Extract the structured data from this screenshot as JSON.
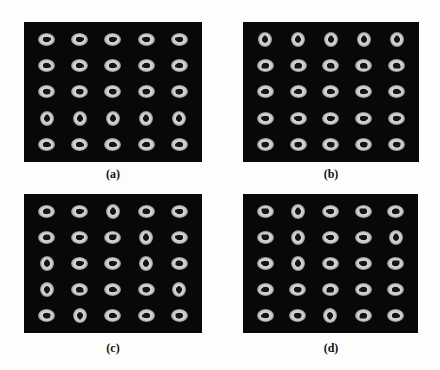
{
  "figure": {
    "panels": [
      {
        "id": "a",
        "caption": "(a)",
        "grid": [
          [
            "h",
            "h",
            "h",
            "h",
            "h"
          ],
          [
            "h",
            "h",
            "h",
            "h",
            "h"
          ],
          [
            "t",
            "t",
            "t",
            "t",
            "t"
          ],
          [
            "v",
            "v",
            "v",
            "v",
            "v"
          ],
          [
            "h",
            "h",
            "h",
            "h",
            "h"
          ]
        ]
      },
      {
        "id": "b",
        "caption": "(b)",
        "grid": [
          [
            "v",
            "v",
            "v",
            "v",
            "v"
          ],
          [
            "b",
            "b",
            "b",
            "b",
            "b"
          ],
          [
            "h",
            "h",
            "h",
            "h",
            "h"
          ],
          [
            "h",
            "h",
            "h",
            "h",
            "h"
          ],
          [
            "t",
            "t",
            "t",
            "t",
            "t"
          ]
        ]
      },
      {
        "id": "c",
        "caption": "(c)",
        "grid": [
          [
            "b",
            "h",
            "v",
            "b",
            "h"
          ],
          [
            "b",
            "h",
            "t",
            "v",
            "h"
          ],
          [
            "v",
            "h",
            "h",
            "v",
            "b"
          ],
          [
            "v",
            "b",
            "h",
            "t",
            "v"
          ],
          [
            "t",
            "v",
            "h",
            "h",
            "t"
          ]
        ]
      },
      {
        "id": "d",
        "caption": "(d)",
        "grid": [
          [
            "t",
            "v",
            "h",
            "t",
            "b"
          ],
          [
            "t",
            "v",
            "h",
            "h",
            "v"
          ],
          [
            "h",
            "v",
            "b",
            "h",
            "t"
          ],
          [
            "h",
            "t",
            "b",
            "h",
            "h"
          ],
          [
            "h",
            "t",
            "v",
            "b",
            "h"
          ]
        ]
      }
    ]
  }
}
